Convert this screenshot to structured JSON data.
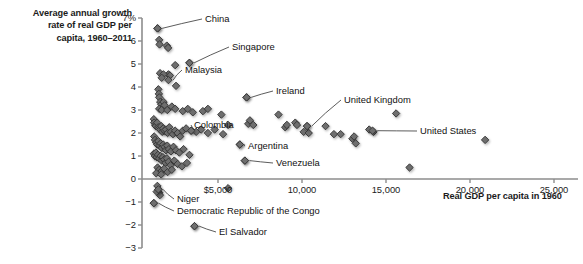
{
  "chart_data": {
    "type": "scatter",
    "title": "Average annual growth rate of real GDP per capita, 1960–2011",
    "title_lines": [
      "Average annual growth",
      "rate of real GDP per",
      "capita, 1960–2011"
    ],
    "xlabel": "Real GDP per capita in 1960",
    "ylabel": "Average annual growth rate of real GDP per capita, 1960–2011",
    "xlim": [
      1000,
      25800
    ],
    "ylim": [
      -3,
      7
    ],
    "grid": false,
    "legend": null,
    "xticks": [
      5000,
      10000,
      15000,
      20000,
      25000
    ],
    "xticklabels": [
      "$5,000",
      "10,000",
      "15,000",
      "20,000",
      "25,000"
    ],
    "yticks": [
      -3,
      -2,
      -1,
      0,
      1,
      2,
      3,
      4,
      5,
      6,
      7
    ],
    "yticklabels": [
      "−3",
      "−2",
      "−1",
      "0",
      "1",
      "2",
      "3",
      "4",
      "5",
      "6",
      "7%"
    ],
    "marker": "diamond",
    "marker_color": "#6e6e6e",
    "marker_edge_color": "#3a3a3a",
    "annotations": [
      {
        "label": "China",
        "x": 1400,
        "y": 6.55,
        "lx": 205,
        "ly": 13,
        "anchor": "left"
      },
      {
        "label": "Singapore",
        "x": 3300,
        "y": 5.05,
        "lx": 232,
        "ly": 41,
        "anchor": "left"
      },
      {
        "label": "Malaysia",
        "x": 2050,
        "y": 4.3,
        "lx": 185,
        "ly": 64,
        "anchor": "left"
      },
      {
        "label": "Ireland",
        "x": 6700,
        "y": 3.55,
        "lx": 276,
        "ly": 85,
        "anchor": "left"
      },
      {
        "label": "United Kingdom",
        "x": 10300,
        "y": 2.3,
        "lx": 344,
        "ly": 94,
        "anchor": "left"
      },
      {
        "label": "United States",
        "x": 14200,
        "y": 2.1,
        "lx": 420,
        "ly": 125,
        "anchor": "left"
      },
      {
        "label": "Colombia",
        "x": 3400,
        "y": 2.1,
        "lx": 194,
        "ly": 119,
        "anchor": "left"
      },
      {
        "label": "Argentina",
        "x": 6300,
        "y": 1.5,
        "lx": 248,
        "ly": 140,
        "anchor": "left"
      },
      {
        "label": "Venezuela",
        "x": 6600,
        "y": 0.8,
        "lx": 276,
        "ly": 157,
        "anchor": "left"
      },
      {
        "label": "Niger",
        "x": 1450,
        "y": -0.45,
        "lx": 177,
        "ly": 193,
        "anchor": "left"
      },
      {
        "label": "Democratic Republic of the Congo",
        "x": 1180,
        "y": -1.05,
        "lx": 177,
        "ly": 205,
        "anchor": "left"
      },
      {
        "label": "El Salvador",
        "x": 3600,
        "y": -2.05,
        "lx": 219,
        "ly": 226,
        "anchor": "left"
      }
    ],
    "points": [
      {
        "x": 1400,
        "y": 6.55
      },
      {
        "x": 1500,
        "y": 6.05
      },
      {
        "x": 1520,
        "y": 5.85
      },
      {
        "x": 1950,
        "y": 5.8
      },
      {
        "x": 2030,
        "y": 5.7
      },
      {
        "x": 3300,
        "y": 5.05
      },
      {
        "x": 2450,
        "y": 4.95
      },
      {
        "x": 2050,
        "y": 4.55
      },
      {
        "x": 2140,
        "y": 4.5
      },
      {
        "x": 1550,
        "y": 4.6
      },
      {
        "x": 1750,
        "y": 4.55
      },
      {
        "x": 1650,
        "y": 4.4
      },
      {
        "x": 2500,
        "y": 4.05
      },
      {
        "x": 1450,
        "y": 3.9
      },
      {
        "x": 1480,
        "y": 3.7
      },
      {
        "x": 1500,
        "y": 3.55
      },
      {
        "x": 1560,
        "y": 3.35
      },
      {
        "x": 1620,
        "y": 3.25
      },
      {
        "x": 1700,
        "y": 3.1
      },
      {
        "x": 1760,
        "y": 3.35
      },
      {
        "x": 1820,
        "y": 3.2
      },
      {
        "x": 1500,
        "y": 3.05
      },
      {
        "x": 1640,
        "y": 3.0
      },
      {
        "x": 1980,
        "y": 3.0
      },
      {
        "x": 2250,
        "y": 3.15
      },
      {
        "x": 2450,
        "y": 3.05
      },
      {
        "x": 2900,
        "y": 2.95
      },
      {
        "x": 3200,
        "y": 3.05
      },
      {
        "x": 3500,
        "y": 2.9
      },
      {
        "x": 4100,
        "y": 2.95
      },
      {
        "x": 4400,
        "y": 3.05
      },
      {
        "x": 5200,
        "y": 2.8
      },
      {
        "x": 6700,
        "y": 3.55
      },
      {
        "x": 6800,
        "y": 2.4
      },
      {
        "x": 6900,
        "y": 2.55
      },
      {
        "x": 7100,
        "y": 2.35
      },
      {
        "x": 8600,
        "y": 2.8
      },
      {
        "x": 9000,
        "y": 2.25
      },
      {
        "x": 9100,
        "y": 2.35
      },
      {
        "x": 9600,
        "y": 2.45
      },
      {
        "x": 9700,
        "y": 2.35
      },
      {
        "x": 10300,
        "y": 2.3
      },
      {
        "x": 10100,
        "y": 2.05
      },
      {
        "x": 10400,
        "y": 2.0
      },
      {
        "x": 11400,
        "y": 2.3
      },
      {
        "x": 11900,
        "y": 1.95
      },
      {
        "x": 12300,
        "y": 1.95
      },
      {
        "x": 13000,
        "y": 1.75
      },
      {
        "x": 13100,
        "y": 1.85
      },
      {
        "x": 13200,
        "y": 1.55
      },
      {
        "x": 14000,
        "y": 2.15
      },
      {
        "x": 14250,
        "y": 2.05
      },
      {
        "x": 15600,
        "y": 2.85
      },
      {
        "x": 16400,
        "y": 0.5
      },
      {
        "x": 20900,
        "y": 1.7
      },
      {
        "x": 1180,
        "y": 2.6
      },
      {
        "x": 1200,
        "y": 2.45
      },
      {
        "x": 1260,
        "y": 2.35
      },
      {
        "x": 1300,
        "y": 2.3
      },
      {
        "x": 1380,
        "y": 2.45
      },
      {
        "x": 1440,
        "y": 2.25
      },
      {
        "x": 1500,
        "y": 2.2
      },
      {
        "x": 1560,
        "y": 2.15
      },
      {
        "x": 1620,
        "y": 2.3
      },
      {
        "x": 1680,
        "y": 2.05
      },
      {
        "x": 1740,
        "y": 2.2
      },
      {
        "x": 1820,
        "y": 2.1
      },
      {
        "x": 1900,
        "y": 2.15
      },
      {
        "x": 2000,
        "y": 2.0
      },
      {
        "x": 2100,
        "y": 2.25
      },
      {
        "x": 2200,
        "y": 2.05
      },
      {
        "x": 2320,
        "y": 1.95
      },
      {
        "x": 2450,
        "y": 2.1
      },
      {
        "x": 2600,
        "y": 2.0
      },
      {
        "x": 2750,
        "y": 1.85
      },
      {
        "x": 2900,
        "y": 2.1
      },
      {
        "x": 3100,
        "y": 2.2
      },
      {
        "x": 3400,
        "y": 2.1
      },
      {
        "x": 3700,
        "y": 2.05
      },
      {
        "x": 4000,
        "y": 2.15
      },
      {
        "x": 4400,
        "y": 2.0
      },
      {
        "x": 4800,
        "y": 2.15
      },
      {
        "x": 5300,
        "y": 1.95
      },
      {
        "x": 5600,
        "y": 2.35
      },
      {
        "x": 6300,
        "y": 1.5
      },
      {
        "x": 1200,
        "y": 1.85
      },
      {
        "x": 1250,
        "y": 1.7
      },
      {
        "x": 1320,
        "y": 1.6
      },
      {
        "x": 1380,
        "y": 1.5
      },
      {
        "x": 1450,
        "y": 1.65
      },
      {
        "x": 1520,
        "y": 1.45
      },
      {
        "x": 1590,
        "y": 1.55
      },
      {
        "x": 1660,
        "y": 1.35
      },
      {
        "x": 1740,
        "y": 1.5
      },
      {
        "x": 1820,
        "y": 1.4
      },
      {
        "x": 1900,
        "y": 1.25
      },
      {
        "x": 1980,
        "y": 1.45
      },
      {
        "x": 2080,
        "y": 1.3
      },
      {
        "x": 2200,
        "y": 1.2
      },
      {
        "x": 2350,
        "y": 1.4
      },
      {
        "x": 2500,
        "y": 1.25
      },
      {
        "x": 2700,
        "y": 1.15
      },
      {
        "x": 2950,
        "y": 1.3
      },
      {
        "x": 3300,
        "y": 1.05
      },
      {
        "x": 1180,
        "y": 1.1
      },
      {
        "x": 1240,
        "y": 1.0
      },
      {
        "x": 1300,
        "y": 1.15
      },
      {
        "x": 1360,
        "y": 0.95
      },
      {
        "x": 1430,
        "y": 1.05
      },
      {
        "x": 1500,
        "y": 0.9
      },
      {
        "x": 1580,
        "y": 1.0
      },
      {
        "x": 1650,
        "y": 0.8
      },
      {
        "x": 1720,
        "y": 0.95
      },
      {
        "x": 1800,
        "y": 0.85
      },
      {
        "x": 1880,
        "y": 0.7
      },
      {
        "x": 1960,
        "y": 0.9
      },
      {
        "x": 2060,
        "y": 0.75
      },
      {
        "x": 2180,
        "y": 0.6
      },
      {
        "x": 2400,
        "y": 0.8
      },
      {
        "x": 2600,
        "y": 0.65
      },
      {
        "x": 2850,
        "y": 0.55
      },
      {
        "x": 3150,
        "y": 0.7
      },
      {
        "x": 6600,
        "y": 0.8
      },
      {
        "x": 1400,
        "y": 0.5
      },
      {
        "x": 1500,
        "y": 0.4
      },
      {
        "x": 1650,
        "y": 0.35
      },
      {
        "x": 1800,
        "y": 0.45
      },
      {
        "x": 2000,
        "y": 0.3
      },
      {
        "x": 2250,
        "y": 0.4
      },
      {
        "x": 1320,
        "y": 0.25
      },
      {
        "x": 1620,
        "y": 0.2
      },
      {
        "x": 1450,
        "y": -0.45
      },
      {
        "x": 1390,
        "y": -0.3
      },
      {
        "x": 1500,
        "y": -0.6
      },
      {
        "x": 1540,
        "y": -0.7
      },
      {
        "x": 1350,
        "y": -0.55
      },
      {
        "x": 5600,
        "y": -0.4
      },
      {
        "x": 1180,
        "y": -1.05
      },
      {
        "x": 3600,
        "y": -2.05
      }
    ]
  }
}
